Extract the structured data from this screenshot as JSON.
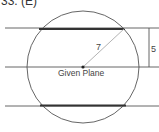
{
  "title": "33. (E)",
  "diagram": {
    "center_label": "Given Plane",
    "radius_label": "7",
    "distance_label": "5",
    "colors": {
      "line": "#555555",
      "chord": "#333333",
      "radius": "#aaaaaa"
    }
  }
}
